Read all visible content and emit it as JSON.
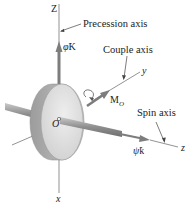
{
  "diagram": {
    "axes": {
      "Z": "Z",
      "x": "x",
      "y": "y",
      "z": "z"
    },
    "callouts": {
      "precession": "Precession axis",
      "couple": "Couple axis",
      "spin": "Spin axis"
    },
    "vectors": {
      "precession_rate": {
        "symbol": "φ̇",
        "unit": "K"
      },
      "couple_moment": {
        "symbol": "M",
        "subscript": "O"
      },
      "spin_rate": {
        "symbol": "ψ̇",
        "unit": "k"
      }
    },
    "origin": "O",
    "colors": {
      "line": "#7a7a7a",
      "arrow": "#808080",
      "disk_face": "#d9d9d9",
      "disk_rim": "#b3b3b3",
      "text": "#222222"
    }
  }
}
